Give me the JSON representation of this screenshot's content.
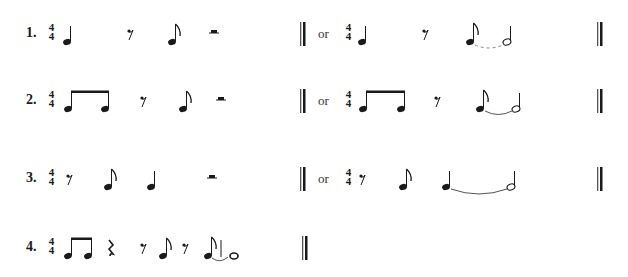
{
  "exercises": [
    {
      "number": "1.",
      "time_signature": {
        "top": "4",
        "bottom": "4"
      },
      "option_a": [
        "quarter-note",
        "eighth-rest",
        "eighth-note",
        "half-rest"
      ],
      "or_label": "or",
      "option_b": [
        "quarter-note",
        "eighth-rest",
        "eighth-note tied to half-note"
      ]
    },
    {
      "number": "2.",
      "time_signature": {
        "top": "4",
        "bottom": "4"
      },
      "option_a": [
        "two beamed eighth-notes",
        "eighth-rest",
        "eighth-note",
        "half-rest"
      ],
      "or_label": "or",
      "option_b": [
        "two beamed eighth-notes",
        "eighth-rest",
        "eighth-note tied to half-note"
      ]
    },
    {
      "number": "3.",
      "time_signature": {
        "top": "4",
        "bottom": "4"
      },
      "option_a": [
        "eighth-rest",
        "eighth-note",
        "quarter-note",
        "half-rest"
      ],
      "or_label": "or",
      "option_b": [
        "eighth-rest",
        "eighth-note",
        "quarter-note tied to half-note"
      ]
    },
    {
      "number": "4.",
      "time_signature": {
        "top": "4",
        "bottom": "4"
      },
      "option_a": [
        "two beamed eighth-notes",
        "quarter-rest",
        "eighth-rest",
        "eighth-note",
        "eighth-rest",
        "eighth-note tied to whole-note"
      ]
    }
  ],
  "colors": {
    "ink": "#1a1a1a",
    "tie": "#777777",
    "background": "#ffffff"
  }
}
